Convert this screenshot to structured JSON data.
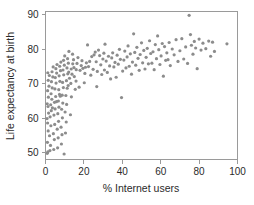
{
  "chart_data": {
    "type": "scatter",
    "title": "",
    "xlabel": "% Internet users",
    "ylabel": "Life expectancy at birth",
    "xlim": [
      0,
      100
    ],
    "ylim": [
      48,
      91
    ],
    "xticks": [
      0,
      20,
      40,
      60,
      80,
      100
    ],
    "yticks": [
      50,
      60,
      70,
      80,
      90
    ],
    "xtick_labels": [
      "0",
      "20",
      "40",
      "60",
      "80",
      "100"
    ],
    "ytick_labels": [
      "50",
      "60",
      "70",
      "80",
      "90"
    ],
    "grid": false,
    "legend": null,
    "marker": {
      "shape": "circle",
      "color": "#8c8c8c",
      "size": 1.6
    },
    "n_points": 191,
    "points": [
      [
        0.9,
        49.8
      ],
      [
        1.2,
        50.2
      ],
      [
        1.0,
        53.0
      ],
      [
        1.4,
        56.3
      ],
      [
        1.1,
        58.6
      ],
      [
        0.8,
        59.9
      ],
      [
        1.6,
        61.5
      ],
      [
        1.3,
        63.4
      ],
      [
        0.9,
        64.2
      ],
      [
        1.5,
        66.1
      ],
      [
        1.1,
        68.0
      ],
      [
        1.8,
        69.3
      ],
      [
        1.4,
        71.0
      ],
      [
        2.0,
        72.4
      ],
      [
        1.2,
        73.2
      ],
      [
        2.3,
        50.6
      ],
      [
        2.6,
        52.1
      ],
      [
        2.1,
        54.9
      ],
      [
        2.8,
        57.8
      ],
      [
        2.4,
        60.4
      ],
      [
        3.0,
        62.2
      ],
      [
        2.7,
        63.9
      ],
      [
        3.3,
        65.5
      ],
      [
        2.9,
        67.1
      ],
      [
        3.5,
        68.8
      ],
      [
        3.1,
        70.6
      ],
      [
        3.8,
        72.0
      ],
      [
        3.4,
        73.5
      ],
      [
        4.0,
        74.9
      ],
      [
        3.6,
        63.0
      ],
      [
        4.3,
        50.9
      ],
      [
        4.6,
        53.8
      ],
      [
        4.1,
        55.5
      ],
      [
        4.8,
        58.2
      ],
      [
        4.4,
        60.9
      ],
      [
        5.0,
        62.7
      ],
      [
        4.7,
        64.6
      ],
      [
        5.3,
        66.3
      ],
      [
        4.9,
        68.5
      ],
      [
        5.5,
        70.2
      ],
      [
        5.1,
        71.8
      ],
      [
        5.8,
        73.1
      ],
      [
        5.4,
        74.4
      ],
      [
        6.0,
        75.6
      ],
      [
        5.7,
        64.8
      ],
      [
        6.3,
        51.4
      ],
      [
        6.6,
        54.3
      ],
      [
        6.1,
        56.8
      ],
      [
        6.8,
        59.1
      ],
      [
        6.4,
        61.3
      ],
      [
        7.0,
        63.2
      ],
      [
        6.7,
        65.0
      ],
      [
        7.3,
        66.9
      ],
      [
        6.9,
        68.3
      ],
      [
        7.5,
        70.7
      ],
      [
        7.1,
        72.3
      ],
      [
        7.8,
        73.8
      ],
      [
        7.4,
        75.1
      ],
      [
        8.0,
        76.3
      ],
      [
        7.7,
        66.4
      ],
      [
        8.3,
        52.5
      ],
      [
        8.6,
        55.2
      ],
      [
        8.1,
        57.4
      ],
      [
        8.8,
        60.1
      ],
      [
        8.4,
        62.6
      ],
      [
        9.0,
        64.4
      ],
      [
        8.7,
        66.7
      ],
      [
        9.3,
        68.9
      ],
      [
        8.9,
        70.4
      ],
      [
        9.5,
        72.6
      ],
      [
        9.1,
        74.0
      ],
      [
        9.8,
        75.4
      ],
      [
        9.4,
        76.8
      ],
      [
        10.0,
        78.1
      ],
      [
        9.7,
        49.6
      ],
      [
        10.4,
        55.7
      ],
      [
        10.8,
        58.9
      ],
      [
        10.2,
        61.8
      ],
      [
        11.0,
        64.0
      ],
      [
        10.6,
        66.6
      ],
      [
        11.3,
        68.7
      ],
      [
        10.9,
        70.9
      ],
      [
        11.6,
        72.9
      ],
      [
        11.2,
        74.6
      ],
      [
        11.9,
        76.0
      ],
      [
        11.5,
        77.3
      ],
      [
        12.2,
        79.4
      ],
      [
        11.8,
        69.5
      ],
      [
        12.5,
        71.6
      ],
      [
        12.1,
        73.4
      ],
      [
        13.0,
        61.0
      ],
      [
        13.5,
        66.2
      ],
      [
        13.2,
        70.1
      ],
      [
        13.8,
        72.8
      ],
      [
        13.4,
        74.3
      ],
      [
        14.2,
        75.8
      ],
      [
        14.6,
        77.0
      ],
      [
        14.1,
        78.6
      ],
      [
        15.0,
        72.1
      ],
      [
        14.8,
        74.7
      ],
      [
        15.5,
        68.4
      ],
      [
        16.0,
        74.1
      ],
      [
        16.4,
        75.9
      ],
      [
        16.9,
        77.6
      ],
      [
        15.9,
        70.8
      ],
      [
        17.5,
        69.0
      ],
      [
        18.0,
        73.9
      ],
      [
        18.6,
        75.3
      ],
      [
        19.0,
        76.7
      ],
      [
        19.5,
        74.5
      ],
      [
        20.2,
        70.3
      ],
      [
        20.8,
        74.8
      ],
      [
        21.3,
        76.1
      ],
      [
        21.9,
        81.3
      ],
      [
        20.5,
        73.0
      ],
      [
        22.4,
        75.0
      ],
      [
        23.0,
        76.5
      ],
      [
        23.6,
        72.5
      ],
      [
        24.1,
        77.9
      ],
      [
        24.8,
        74.2
      ],
      [
        25.3,
        78.4
      ],
      [
        25.9,
        79.2
      ],
      [
        26.4,
        76.4
      ],
      [
        27.0,
        73.6
      ],
      [
        26.7,
        69.2
      ],
      [
        27.6,
        79.8
      ],
      [
        28.2,
        78.2
      ],
      [
        28.8,
        75.5
      ],
      [
        29.3,
        72.7
      ],
      [
        29.9,
        77.2
      ],
      [
        30.4,
        78.9
      ],
      [
        31.0,
        81.5
      ],
      [
        30.7,
        74.0
      ],
      [
        31.6,
        76.6
      ],
      [
        32.2,
        73.3
      ],
      [
        32.8,
        78.0
      ],
      [
        33.4,
        75.2
      ],
      [
        33.9,
        71.4
      ],
      [
        34.5,
        77.5
      ],
      [
        35.0,
        79.0
      ],
      [
        35.6,
        74.9
      ],
      [
        36.2,
        76.2
      ],
      [
        36.8,
        71.9
      ],
      [
        37.3,
        78.3
      ],
      [
        37.9,
        75.7
      ],
      [
        38.5,
        80.0
      ],
      [
        39.0,
        77.1
      ],
      [
        39.6,
        66.0
      ],
      [
        40.2,
        73.7
      ],
      [
        40.8,
        76.9
      ],
      [
        41.3,
        79.5
      ],
      [
        41.9,
        74.6
      ],
      [
        42.5,
        77.8
      ],
      [
        43.0,
        81.0
      ],
      [
        43.6,
        75.1
      ],
      [
        44.2,
        78.7
      ],
      [
        44.8,
        72.8
      ],
      [
        45.3,
        76.3
      ],
      [
        45.9,
        84.5
      ],
      [
        46.5,
        79.1
      ],
      [
        47.0,
        75.4
      ],
      [
        47.6,
        80.6
      ],
      [
        48.2,
        77.4
      ],
      [
        48.8,
        73.9
      ],
      [
        49.3,
        78.5
      ],
      [
        50.0,
        81.9
      ],
      [
        50.6,
        76.1
      ],
      [
        51.2,
        79.7
      ],
      [
        51.8,
        74.3
      ],
      [
        52.4,
        77.7
      ],
      [
        53.0,
        80.3
      ],
      [
        53.6,
        75.8
      ],
      [
        54.2,
        82.5
      ],
      [
        54.8,
        78.8
      ],
      [
        55.4,
        76.0
      ],
      [
        56.0,
        79.3
      ],
      [
        56.6,
        74.1
      ],
      [
        57.2,
        81.4
      ],
      [
        57.8,
        77.3
      ],
      [
        58.4,
        83.9
      ],
      [
        59.0,
        79.9
      ],
      [
        59.6,
        75.6
      ],
      [
        60.2,
        78.1
      ],
      [
        60.8,
        81.7
      ],
      [
        61.4,
        72.2
      ],
      [
        62.0,
        80.8
      ],
      [
        62.6,
        76.8
      ],
      [
        63.2,
        79.0
      ],
      [
        63.8,
        77.0
      ],
      [
        64.4,
        82.0
      ],
      [
        65.0,
        75.3
      ],
      [
        66.0,
        80.1
      ],
      [
        67.0,
        78.4
      ],
      [
        68.0,
        82.8
      ],
      [
        69.0,
        76.5
      ],
      [
        70.0,
        79.6
      ],
      [
        71.0,
        83.1
      ],
      [
        72.0,
        77.2
      ],
      [
        73.0,
        80.7
      ],
      [
        74.0,
        75.9
      ],
      [
        74.8,
        89.9
      ],
      [
        75.5,
        84.3
      ],
      [
        76.0,
        81.2
      ],
      [
        76.8,
        78.6
      ],
      [
        77.5,
        82.3
      ],
      [
        78.2,
        80.4
      ],
      [
        79.0,
        74.4
      ],
      [
        80.0,
        83.0
      ],
      [
        81.0,
        79.8
      ],
      [
        82.0,
        81.8
      ],
      [
        83.5,
        80.2
      ],
      [
        85.0,
        82.4
      ],
      [
        86.0,
        78.0
      ],
      [
        87.0,
        82.1
      ],
      [
        88.0,
        79.4
      ],
      [
        94.5,
        81.6
      ]
    ]
  }
}
